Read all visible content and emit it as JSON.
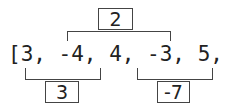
{
  "array": {
    "text": "[3, -4, 4, -3, 5, -9]",
    "values": [
      3,
      -4,
      4,
      -3,
      5,
      -9
    ]
  },
  "top_group": {
    "sum": "2",
    "range": "-4, 4, -3, 5"
  },
  "bottom_left_group": {
    "sum": "3",
    "range": "3, -4, 4"
  },
  "bottom_right_group": {
    "sum": "-7",
    "range": "-3, 5, -9"
  }
}
